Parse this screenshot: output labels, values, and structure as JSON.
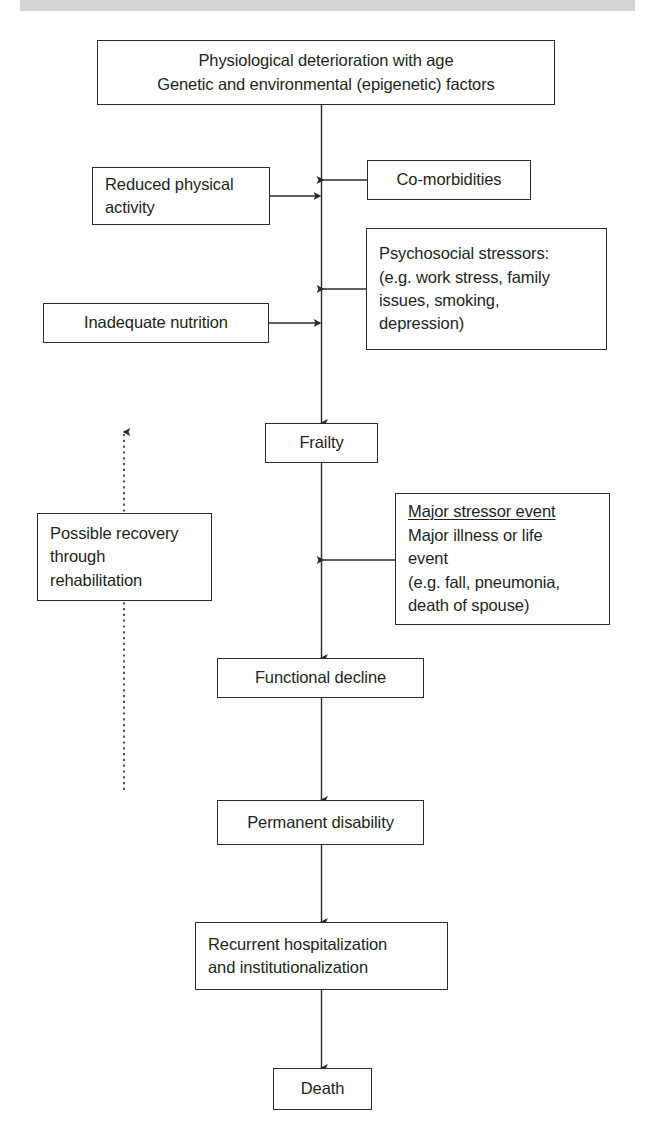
{
  "page": {
    "background_color": "#ffffff",
    "line_color": "#2b2b2b",
    "text_color": "#231f20",
    "top_bar_color": "#d4d4d4"
  },
  "nodes": {
    "physiological": {
      "label": "Physiological deterioration with age\nGenetic and environmental (epigenetic) factors"
    },
    "reduced_activity": {
      "label": "Reduced physical\nactivity"
    },
    "comorbidities": {
      "label": "Co-morbidities"
    },
    "psychosocial": {
      "label": "Psychosocial stressors:\n(e.g. work stress, family\nissues, smoking,\ndepression)"
    },
    "nutrition": {
      "label": "Inadequate nutrition"
    },
    "frailty": {
      "label": "Frailty"
    },
    "recovery": {
      "label": "Possible recovery\nthrough\nrehabilitation"
    },
    "stressor": {
      "label_underlined": "Major stressor event",
      "label_rest": "Major illness or life\nevent\n(e.g. fall, pneumonia,\ndeath of spouse)"
    },
    "functional_decline": {
      "label": "Functional decline"
    },
    "permanent_disability": {
      "label": "Permanent disability"
    },
    "recurrent_hospitalization": {
      "label": "Recurrent hospitalization\nand institutionalization"
    },
    "death": {
      "label": "Death"
    }
  },
  "edges": [
    {
      "name": "physiological-to-frailty",
      "style": "solid",
      "direction": "down"
    },
    {
      "name": "reduced-activity-to-spine",
      "style": "solid",
      "direction": "right"
    },
    {
      "name": "comorbidities-to-spine",
      "style": "solid",
      "direction": "left"
    },
    {
      "name": "psychosocial-to-spine",
      "style": "solid",
      "direction": "left"
    },
    {
      "name": "nutrition-to-spine",
      "style": "solid",
      "direction": "right"
    },
    {
      "name": "frailty-to-functional-decline",
      "style": "solid",
      "direction": "down"
    },
    {
      "name": "stressor-to-spine",
      "style": "solid",
      "direction": "left"
    },
    {
      "name": "functional-decline-to-permanent-disability",
      "style": "solid",
      "direction": "down"
    },
    {
      "name": "permanent-disability-to-recurrent-hospitalization",
      "style": "solid",
      "direction": "down"
    },
    {
      "name": "recurrent-hospitalization-to-death",
      "style": "solid",
      "direction": "down"
    },
    {
      "name": "recovery-upward-dotted",
      "style": "dotted",
      "direction": "up"
    }
  ]
}
